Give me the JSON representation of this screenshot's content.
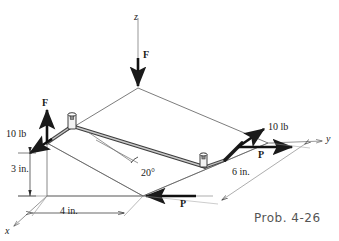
{
  "figure": {
    "caption": "Prob. 4-26",
    "axes": {
      "z_label": "z",
      "y_label": "y",
      "x_label": "x"
    },
    "forces": {
      "f_top_label": "F",
      "f_origin_label": "F",
      "p_right_label": "P",
      "p_bottom_label": "P",
      "magnitude_left": "10 lb",
      "magnitude_right": "10 lb"
    },
    "dimensions": {
      "vertical": "3 in.",
      "horizontal": "4 in.",
      "depth": "6 in."
    },
    "angle": {
      "value": "20°"
    },
    "colors": {
      "line": "#1a1a1a",
      "thin_line": "#7d7d7d",
      "rod_fill": "#9a9a9a",
      "background": "#ffffff",
      "caption": "#555555"
    }
  }
}
